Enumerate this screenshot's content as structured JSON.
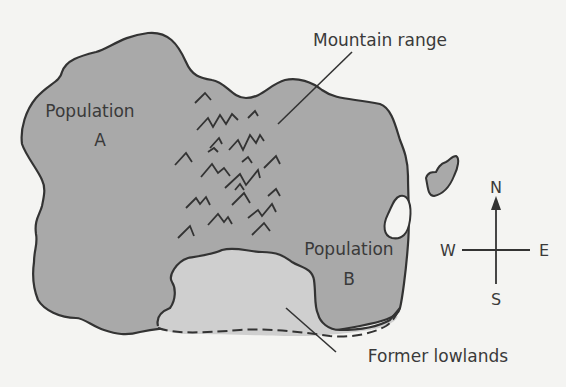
{
  "diagram": {
    "type": "island map",
    "colors": {
      "background": "#f4f4f2",
      "land": "#a9a9a9",
      "lowlands": "#cfcfcf",
      "outline": "#333333",
      "text": "#3a3a3a"
    },
    "labels": {
      "population_a_line1": "Population",
      "population_a_line2": "A",
      "population_b_line1": "Population",
      "population_b_line2": "B",
      "mountain_range": "Mountain range",
      "former_lowlands": "Former lowlands"
    },
    "compass": {
      "north": "N",
      "south": "S",
      "east": "E",
      "west": "W"
    }
  }
}
